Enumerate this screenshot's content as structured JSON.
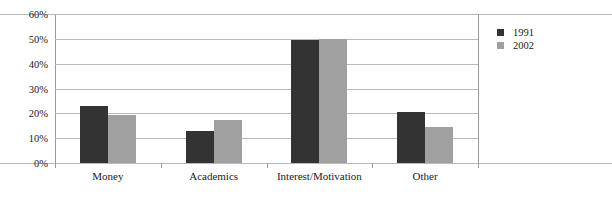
{
  "chart_data": {
    "type": "bar",
    "title": "",
    "subtitle": "",
    "xlabel": "",
    "ylabel": "",
    "categories": [
      "Money",
      "Academics",
      "Interest/Motivation",
      "Other"
    ],
    "series": [
      {
        "name": "1991",
        "color": "#333333",
        "values": [
          23,
          13,
          49.5,
          20.5
        ]
      },
      {
        "name": "2002",
        "color": "#a0a0a0",
        "values": [
          19.5,
          17.5,
          50,
          14.5
        ]
      }
    ],
    "ylim": [
      0,
      60
    ],
    "ytick_step": 10,
    "ytick_labels": [
      "60%",
      "50%",
      "40%",
      "30%",
      "20%",
      "10%",
      "0%"
    ],
    "ytick_values": [
      60,
      50,
      40,
      30,
      20,
      10,
      0
    ],
    "value_suffix": "%",
    "grid": true,
    "legend_position": "right",
    "legend_entries": [
      "1991",
      "2002"
    ],
    "colors": {
      "series_1991": "#333333",
      "series_2002": "#a0a0a0",
      "gridline": "#b9b9b9",
      "axis": "#9a9a9a",
      "text": "#1a1a1a",
      "background": "#ffffff"
    }
  }
}
